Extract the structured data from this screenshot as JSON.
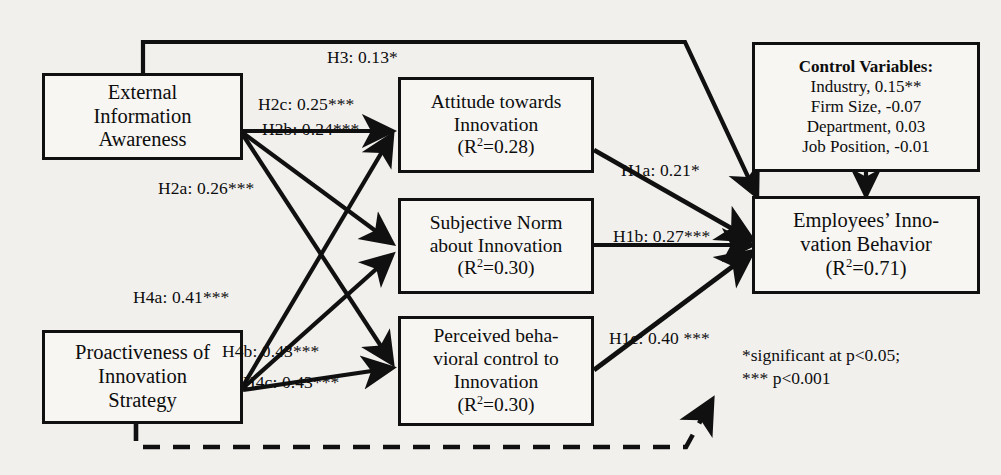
{
  "diagram": {
    "type": "path-model",
    "line_color": "#101010",
    "box_fill": "#f7f6f3",
    "background": "#f2f0ed"
  },
  "nodes": {
    "external_information_awareness": {
      "name": "External Information Awareness",
      "lines": [
        "External",
        "Information",
        "Awareness"
      ]
    },
    "proactiveness_innovation_strategy": {
      "name": "Proactiveness of Innovation Strategy",
      "lines": [
        "Proactiveness of",
        "Innovation",
        "Strategy"
      ]
    },
    "attitude_towards_innovation": {
      "name": "Attitude towards Innovation",
      "lines": [
        "Attitude towards",
        "Innovation"
      ],
      "r2_prefix": "(R",
      "r2_sup": "2",
      "r2_suffix": "=0.28)"
    },
    "subjective_norm": {
      "name": "Subjective Norm about Innovation",
      "lines": [
        "Subjective Norm",
        "about Innovation"
      ],
      "r2_prefix": "(R",
      "r2_sup": "2",
      "r2_suffix": "=0.30)"
    },
    "perceived_behavioral_control": {
      "name": "Perceived behavioral control to Innovation",
      "lines": [
        "Perceived beha-",
        "vioral control to",
        "Innovation"
      ],
      "r2_prefix": "(R",
      "r2_sup": "2",
      "r2_suffix": "=0.30)"
    },
    "employees_innovation_behavior": {
      "name": "Employees' Innovation Behavior",
      "lines": [
        "Employees’ Inno-",
        "vation Behavior"
      ],
      "r2_prefix": "(R",
      "r2_sup": "2",
      "r2_suffix": "=0.71)"
    },
    "control_variables": {
      "name": "Control Variables",
      "heading": "Control Variables:",
      "items": [
        "Industry, 0.15**",
        "Firm Size, -0.07",
        "Department, 0.03",
        "Job Position, -0.01"
      ]
    }
  },
  "paths": {
    "h3": {
      "label": "H3: 0.13*",
      "from": "external_information_awareness",
      "to": "employees_innovation_behavior"
    },
    "h2c": {
      "label": "H2c: 0.25***",
      "from": "external_information_awareness",
      "to": "attitude_towards_innovation"
    },
    "h2b": {
      "label": "H2b: 0.24***",
      "from": "external_information_awareness",
      "to": "subjective_norm"
    },
    "h2a": {
      "label": "H2a: 0.26***",
      "from": "external_information_awareness",
      "to": "perceived_behavioral_control"
    },
    "h4a": {
      "label": "H4a: 0.41***",
      "from": "proactiveness_innovation_strategy",
      "to": "attitude_towards_innovation"
    },
    "h4b": {
      "label": "H4b: 0.43***",
      "from": "proactiveness_innovation_strategy",
      "to": "subjective_norm"
    },
    "h4c": {
      "label": "H4c: 0.43***",
      "from": "proactiveness_innovation_strategy",
      "to": "perceived_behavioral_control"
    },
    "h1a": {
      "label": "H1a: 0.21*",
      "from": "attitude_towards_innovation",
      "to": "employees_innovation_behavior"
    },
    "h1b": {
      "label": "H1b: 0.27***",
      "from": "subjective_norm",
      "to": "employees_innovation_behavior"
    },
    "h1c": {
      "label": "H1c: 0.40 ***",
      "from": "perceived_behavioral_control",
      "to": "employees_innovation_behavior"
    },
    "moderation_dashed": {
      "label": "",
      "from": "proactiveness_innovation_strategy",
      "to": "employees_innovation_behavior",
      "style": "dashed"
    },
    "controls": {
      "label": "",
      "from": "control_variables",
      "to": "employees_innovation_behavior"
    }
  },
  "legend": {
    "lines": [
      "*significant at p<0.05;",
      "*** p<0.001"
    ]
  }
}
